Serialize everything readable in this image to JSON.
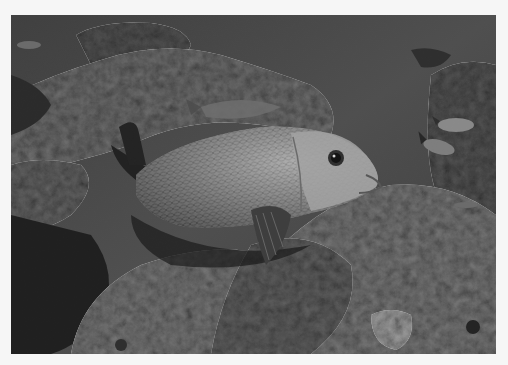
{
  "image": {
    "kind": "photograph",
    "mode": "grayscale",
    "background_color": "#f6f6f6",
    "frame": {
      "x": 11,
      "y": 15,
      "width": 485,
      "height": 339
    },
    "subjects": [
      {
        "name": "main-fish",
        "description": "large scaled reef fish with dark dorsal/caudal fins, facing right"
      },
      {
        "name": "small-fish",
        "count": 4,
        "description": "small fish along right edge"
      },
      {
        "name": "coral-reef",
        "description": "textured rocky reef covering lower portion and left"
      }
    ],
    "palette": {
      "water": "#4a4a4a",
      "reef_light": "#8e8e8e",
      "reef_dark": "#262626",
      "fish_body": "#9a9a9a",
      "shadow": "#141414"
    }
  }
}
